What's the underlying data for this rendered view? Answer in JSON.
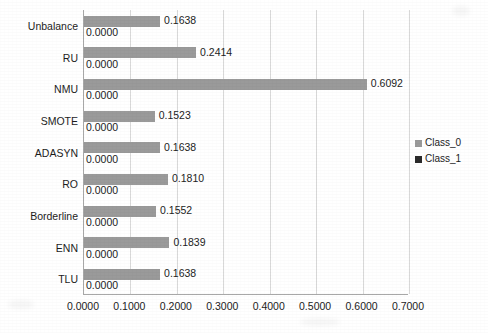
{
  "chart_data": {
    "type": "bar",
    "orientation": "horizontal",
    "title": "",
    "xlabel": "",
    "ylabel": "",
    "xlim": [
      0.0,
      0.7
    ],
    "xticks": [
      "0.0000",
      "0.1000",
      "0.2000",
      "0.3000",
      "0.4000",
      "0.5000",
      "0.6000",
      "0.7000"
    ],
    "xtick_values": [
      0.0,
      0.1,
      0.2,
      0.3,
      0.4,
      0.5,
      0.6,
      0.7
    ],
    "grid": true,
    "grid_axis": "x",
    "legend_position": "right",
    "categories": [
      "Unbalance",
      "RU",
      "NMU",
      "SMOTE",
      "ADASYN",
      "RO",
      "Borderline",
      "ENN",
      "TLU"
    ],
    "series": [
      {
        "name": "Class_0",
        "color": "#9a9a9a",
        "values": [
          0.1638,
          0.2414,
          0.6092,
          0.1523,
          0.1638,
          0.181,
          0.1552,
          0.1839,
          0.1638
        ],
        "labels": [
          "0.1638",
          "0.2414",
          "0.6092",
          "0.1523",
          "0.1638",
          "0.1810",
          "0.1552",
          "0.1839",
          "0.1638"
        ]
      },
      {
        "name": "Class_1",
        "color": "#2b2b2b",
        "values": [
          0.0,
          0.0,
          0.0,
          0.0,
          0.0,
          0.0,
          0.0,
          0.0,
          0.0
        ],
        "labels": [
          "0.0000",
          "0.0000",
          "0.0000",
          "0.0000",
          "0.0000",
          "0.0000",
          "0.0000",
          "0.0000",
          "0.0000"
        ]
      }
    ],
    "legend": [
      {
        "label": "Class_0",
        "color": "#9a9a9a"
      },
      {
        "label": "Class_1",
        "color": "#2b2b2b"
      }
    ]
  }
}
